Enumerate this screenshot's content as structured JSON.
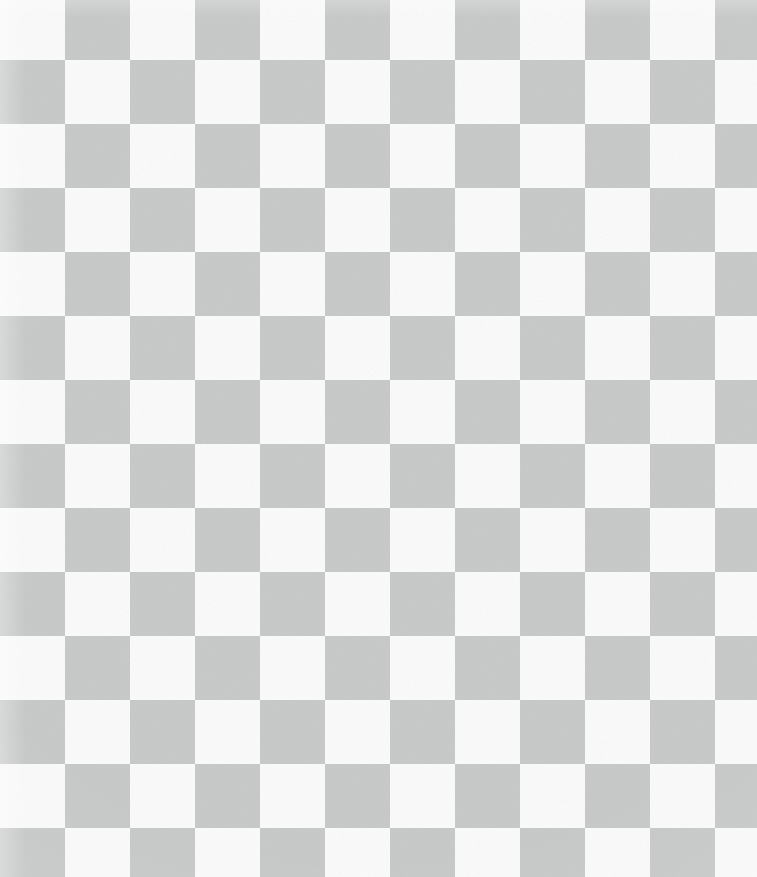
{
  "image": {
    "kind": "checkerboard-texture",
    "description": "Two-tone checkerboard / transparency-grid pattern filling the entire frame",
    "width_px": 757,
    "height_px": 877,
    "has_text": false,
    "has_ui_chrome": false
  },
  "pattern": {
    "name": "checkerboard",
    "cell_width_px": 65,
    "cell_height_px": 64,
    "origin_x_px": 0,
    "origin_y_px": 0,
    "columns_visible": 12,
    "rows_visible": 14,
    "last_column_partial_width_px": 49,
    "first_row_height_px": 60,
    "last_row_partial_height_px": 44,
    "top_left_cell_tone": "light",
    "phase_rule": "dark when (row + column) is odd",
    "colors": {
      "light": "#fbfbfb",
      "dark": "#c9cbcb",
      "page_background": "#ffffff"
    },
    "texture": {
      "grain": "fine film grain / paper noise over the whole frame",
      "grain_opacity": 0.55,
      "vignette": "subtle lighter wash toward the outer edges and corners"
    }
  }
}
